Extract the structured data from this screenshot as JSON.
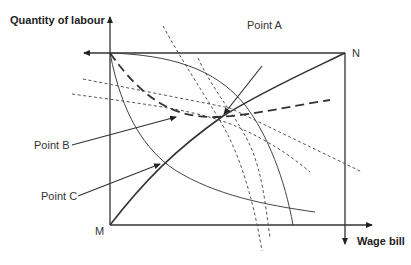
{
  "diagram": {
    "type": "Edgeworth-style box diagram",
    "axes": {
      "vertical_label": "Quantity of labour",
      "horizontal_label": "Wage bill"
    },
    "corners": {
      "origin_bottom_left": "M",
      "origin_top_right": "N"
    },
    "points": {
      "a": "Point A",
      "b": "Point B",
      "c": "Point C"
    },
    "elements": [
      "box frame",
      "contract curve (solid diagonal M to N)",
      "bold dashed curve",
      "thin convex curve from top-left",
      "thin concave curve from top-left",
      "two steep dotted curves",
      "two shallow dotted lines"
    ]
  },
  "colors": {
    "line": "#333333",
    "background": "#ffffff"
  }
}
